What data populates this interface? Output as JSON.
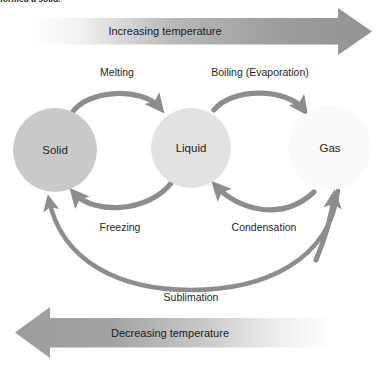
{
  "caption": {
    "clipped_text": "formed a solid."
  },
  "diagram": {
    "states": [
      {
        "id": "solid",
        "label": "Solid",
        "cx": 55,
        "cy": 150,
        "r": 42,
        "fill": "#c9c9c9"
      },
      {
        "id": "liquid",
        "label": "Liquid",
        "cx": 191,
        "cy": 148,
        "r": 40,
        "fill": "#e2e2e2"
      },
      {
        "id": "gas",
        "label": "Gas",
        "cx": 330,
        "cy": 148,
        "r": 42,
        "fill": "#fafafa"
      }
    ],
    "transitions": [
      {
        "id": "melting",
        "label": "Melting",
        "from": "solid",
        "to": "liquid",
        "x": 117,
        "y": 72,
        "direction": "forward"
      },
      {
        "id": "boiling",
        "label": "Boiling (Evaporation)",
        "from": "liquid",
        "to": "gas",
        "x": 260,
        "y": 72,
        "direction": "forward"
      },
      {
        "id": "freezing",
        "label": "Freezing",
        "from": "liquid",
        "to": "solid",
        "x": 120,
        "y": 227,
        "direction": "reverse"
      },
      {
        "id": "condensation",
        "label": "Condensation",
        "from": "gas",
        "to": "liquid",
        "x": 264,
        "y": 227,
        "direction": "reverse"
      },
      {
        "id": "sublimation",
        "label": "Sublimation",
        "from": "solid",
        "to": "gas",
        "x": 191,
        "y": 297,
        "direction": "arc"
      }
    ],
    "temperature_arrows": [
      {
        "id": "increasing",
        "label": "Increasing temperature",
        "direction": "right",
        "x": 165,
        "y": 31
      },
      {
        "id": "decreasing",
        "label": "Decreasing temperature",
        "direction": "left",
        "x": 170,
        "y": 333
      }
    ],
    "colors": {
      "arrow_gray": "#8d8d8d",
      "band_dark": "#9b9b9b",
      "band_light": "#ffffff",
      "text": "#231f20"
    }
  }
}
